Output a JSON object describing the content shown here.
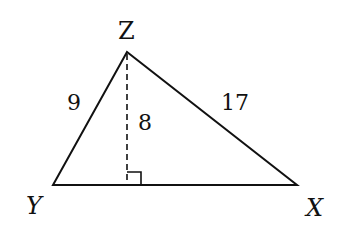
{
  "diagram": {
    "type": "triangle",
    "vertices": {
      "Z": {
        "label": "Z",
        "x": 127,
        "y": 52
      },
      "Y": {
        "label": "Y",
        "x": 53,
        "y": 185
      },
      "X": {
        "label": "X",
        "x": 297,
        "y": 185
      }
    },
    "sides": {
      "YZ": {
        "label": "9"
      },
      "ZX": {
        "label": "17"
      }
    },
    "altitude": {
      "label": "8",
      "from": "Z",
      "style": "dashed",
      "right_angle_marker": true
    },
    "colors": {
      "stroke": "#111111",
      "background": "#ffffff"
    }
  }
}
